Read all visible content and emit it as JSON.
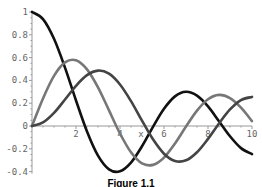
{
  "chart_data": {
    "type": "line",
    "title": "",
    "caption": "Figure 1.1",
    "xlabel": "x",
    "ylabel": "",
    "xlim": [
      0,
      10
    ],
    "ylim": [
      -0.4,
      1.0
    ],
    "grid": false,
    "legend": null,
    "x_ticks": [
      2,
      4,
      6,
      8,
      10
    ],
    "x_tick_labels": [
      "2",
      "4",
      "6",
      "8",
      "10"
    ],
    "y_ticks": [
      -0.4,
      -0.2,
      0,
      0.2,
      0.4,
      0.6,
      0.8,
      1
    ],
    "y_tick_labels": [
      "-0.4",
      "-0.2",
      "0",
      "0.2",
      "0.4",
      "0.6",
      "0.8",
      "1"
    ],
    "x": [
      0,
      0.5,
      1,
      1.5,
      2,
      2.5,
      3,
      3.5,
      4,
      4.5,
      5,
      5.5,
      6,
      6.5,
      7,
      7.5,
      8,
      8.5,
      9,
      9.5,
      10
    ],
    "series": [
      {
        "name": "J0(x)",
        "color": "#111111",
        "values": [
          1.0,
          0.938,
          0.765,
          0.512,
          0.224,
          -0.048,
          -0.26,
          -0.38,
          -0.397,
          -0.321,
          -0.178,
          -0.007,
          0.151,
          0.26,
          0.3,
          0.266,
          0.172,
          0.042,
          -0.09,
          -0.194,
          -0.246
        ]
      },
      {
        "name": "J1(x)",
        "color": "#777777",
        "values": [
          0.0,
          0.242,
          0.44,
          0.558,
          0.577,
          0.497,
          0.339,
          0.137,
          -0.066,
          -0.231,
          -0.328,
          -0.341,
          -0.277,
          -0.154,
          -0.005,
          0.135,
          0.235,
          0.273,
          0.245,
          0.161,
          0.043
        ]
      },
      {
        "name": "J2(x)",
        "color": "#444444",
        "values": [
          0.0,
          0.031,
          0.115,
          0.232,
          0.353,
          0.446,
          0.486,
          0.459,
          0.364,
          0.218,
          0.047,
          -0.117,
          -0.243,
          -0.307,
          -0.301,
          -0.23,
          -0.113,
          0.022,
          0.145,
          0.228,
          0.255
        ]
      }
    ]
  }
}
